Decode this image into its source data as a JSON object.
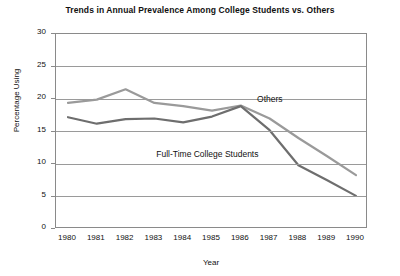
{
  "chart_data": {
    "type": "line",
    "title": "Trends in Annual Prevalence Among College Students vs. Others",
    "xlabel": "Year",
    "ylabel": "Percentage Using",
    "categories": [
      "1980",
      "1981",
      "1982",
      "1983",
      "1984",
      "1985",
      "1986",
      "1987",
      "1988",
      "1989",
      "1990"
    ],
    "x": [
      1980,
      1981,
      1982,
      1983,
      1984,
      1985,
      1986,
      1987,
      1988,
      1989,
      1990
    ],
    "xlim": [
      1980,
      1990
    ],
    "ylim": [
      0,
      30
    ],
    "yticks": [
      0,
      5,
      10,
      15,
      20,
      25,
      30
    ],
    "grid": true,
    "grid_axis": "y",
    "legend": "inline-annotations",
    "series": [
      {
        "name": "Others",
        "color": "#9a9a9a",
        "values": [
          19.4,
          19.9,
          21.5,
          19.4,
          18.9,
          18.2,
          19.0,
          17.0,
          14.0,
          11.2,
          8.3
        ]
      },
      {
        "name": "Full-Time College Students",
        "color": "#6e6e6e",
        "values": [
          17.2,
          16.2,
          16.9,
          17.0,
          16.4,
          17.3,
          18.9,
          15.2,
          9.8,
          7.5,
          5.1
        ]
      }
    ],
    "annotations": [
      {
        "text": "Others",
        "x": 1986.6,
        "y": 19.9
      },
      {
        "text": "Full-Time College Students",
        "x": 1983.1,
        "y": 11.4
      }
    ]
  }
}
